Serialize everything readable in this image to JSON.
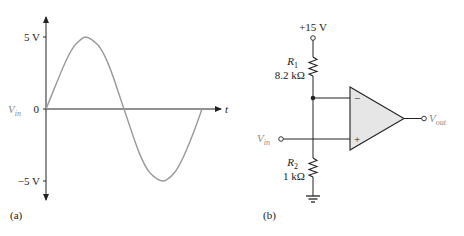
{
  "panel_a": {
    "label": "(a)",
    "y_ticks": {
      "top": "5 V",
      "zero": "0",
      "bottom": "−5 V"
    },
    "y_label_main": "V",
    "y_label_sub": "in",
    "x_label": "t",
    "waveform": "sine",
    "colors": {
      "axes": "#222222",
      "waveform": "#9a9a9a"
    }
  },
  "panel_b": {
    "label": "(b)",
    "supply": "+15 V",
    "r1": {
      "name_main": "R",
      "name_sub": "1",
      "value": "8.2 kΩ"
    },
    "r2": {
      "name_main": "R",
      "name_sub": "2",
      "value": "1 kΩ"
    },
    "input": {
      "main": "V",
      "sub": "in"
    },
    "output": {
      "main": "V",
      "sub": "out"
    },
    "opamp": {
      "inverting": "−",
      "noninverting": "+"
    },
    "colors": {
      "wire": "#222222",
      "opamp_fill": "#e6e6e6",
      "terminal_label": "#8a8a8a"
    }
  }
}
